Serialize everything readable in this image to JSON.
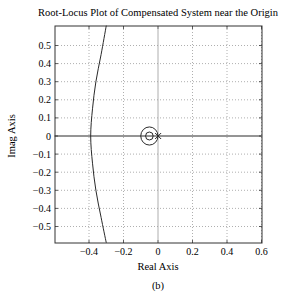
{
  "chart_data": {
    "type": "line",
    "title": "Root-Locus Plot of Compensated System near the Origin",
    "xlabel": "Real Axis",
    "ylabel": "Imag Axis",
    "caption": "(b)",
    "xlim": [
      -0.6,
      0.6
    ],
    "ylim": [
      -0.6,
      0.6
    ],
    "xticks": [
      -0.4,
      -0.2,
      0,
      0.2,
      0.4,
      0.6
    ],
    "xtick_labels": [
      "−0.4",
      "−0.2",
      "0",
      "0.2",
      "0.4",
      "0.6"
    ],
    "yticks": [
      0.5,
      0.4,
      0.3,
      0.2,
      0.1,
      0,
      -0.1,
      -0.2,
      -0.3,
      -0.4,
      -0.5
    ],
    "ytick_labels": [
      "0.5",
      "0.4",
      "0.3",
      "0.2",
      "0.1",
      "0",
      "−0.1",
      "−0.2",
      "−0.3",
      "−0.4",
      "−0.5"
    ],
    "grid": true,
    "series": [
      {
        "name": "root-locus branch (near-vertical arc)",
        "points": [
          [
            -0.3,
            0.61
          ],
          [
            -0.33,
            0.45
          ],
          [
            -0.36,
            0.3
          ],
          [
            -0.38,
            0.15
          ],
          [
            -0.39,
            0.0
          ],
          [
            -0.38,
            -0.15
          ],
          [
            -0.36,
            -0.3
          ],
          [
            -0.33,
            -0.45
          ],
          [
            -0.3,
            -0.59
          ]
        ]
      },
      {
        "name": "real-axis locus",
        "points": [
          [
            -0.6,
            0.0
          ],
          [
            0.6,
            0.0
          ]
        ]
      },
      {
        "name": "small loop around compensator zero (outer)",
        "shape": "circle",
        "center": [
          -0.05,
          0.0
        ],
        "radius": 0.05
      },
      {
        "name": "compensator zero",
        "shape": "o-marker",
        "center": [
          -0.05,
          0.0
        ],
        "radius": 0.022
      },
      {
        "name": "compensator pole",
        "shape": "x-marker",
        "center": [
          -0.005,
          0.0
        ]
      }
    ],
    "legend": null
  },
  "colors": {
    "line": "#2a2a2a",
    "grid": "#9a9a9a",
    "frame": "#333333"
  }
}
